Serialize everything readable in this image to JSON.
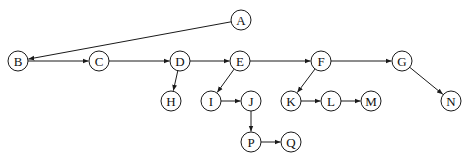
{
  "diagram": {
    "type": "directed-graph",
    "node_radius": 10,
    "stroke_color": "#1a1a1a",
    "background": "#ffffff",
    "nodes": [
      {
        "id": "A",
        "label": "A",
        "x": 241,
        "y": 20
      },
      {
        "id": "B",
        "label": "B",
        "x": 18,
        "y": 61
      },
      {
        "id": "C",
        "label": "C",
        "x": 99,
        "y": 61
      },
      {
        "id": "D",
        "label": "D",
        "x": 180,
        "y": 61
      },
      {
        "id": "E",
        "label": "E",
        "x": 240,
        "y": 61
      },
      {
        "id": "F",
        "label": "F",
        "x": 321,
        "y": 61
      },
      {
        "id": "G",
        "label": "G",
        "x": 402,
        "y": 61
      },
      {
        "id": "H",
        "label": "H",
        "x": 171,
        "y": 101
      },
      {
        "id": "I",
        "label": "I",
        "x": 211,
        "y": 101
      },
      {
        "id": "J",
        "label": "J",
        "x": 251,
        "y": 101
      },
      {
        "id": "K",
        "label": "K",
        "x": 291,
        "y": 101
      },
      {
        "id": "L",
        "label": "L",
        "x": 331,
        "y": 101
      },
      {
        "id": "M",
        "label": "M",
        "x": 371,
        "y": 101
      },
      {
        "id": "N",
        "label": "N",
        "x": 451,
        "y": 101
      },
      {
        "id": "P",
        "label": "P",
        "x": 251,
        "y": 142
      },
      {
        "id": "Q",
        "label": "Q",
        "x": 291,
        "y": 142
      }
    ],
    "edges": [
      {
        "from": "A",
        "to": "B"
      },
      {
        "from": "B",
        "to": "C"
      },
      {
        "from": "C",
        "to": "D"
      },
      {
        "from": "D",
        "to": "E"
      },
      {
        "from": "D",
        "to": "H"
      },
      {
        "from": "E",
        "to": "F"
      },
      {
        "from": "E",
        "to": "I"
      },
      {
        "from": "F",
        "to": "G"
      },
      {
        "from": "F",
        "to": "K"
      },
      {
        "from": "G",
        "to": "N"
      },
      {
        "from": "I",
        "to": "J"
      },
      {
        "from": "J",
        "to": "P"
      },
      {
        "from": "K",
        "to": "L"
      },
      {
        "from": "L",
        "to": "M"
      },
      {
        "from": "P",
        "to": "Q"
      }
    ]
  }
}
